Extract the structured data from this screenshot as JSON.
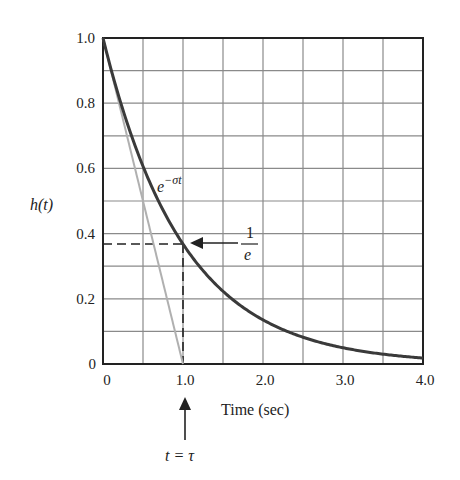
{
  "chart_data": {
    "type": "line",
    "title": "",
    "xlabel": "Time (sec)",
    "ylabel": "h(t)",
    "xlim": [
      0,
      4.0
    ],
    "ylim": [
      0,
      1.0
    ],
    "grid": true,
    "x_ticks": [
      "0",
      "1.0",
      "2.0",
      "3.0",
      "4.0"
    ],
    "y_ticks": [
      "0",
      "0.2",
      "0.4",
      "0.6",
      "0.8",
      "1.0"
    ],
    "x_grid_step": 0.5,
    "y_grid_step": 0.1,
    "series": [
      {
        "name": "e^{-σt}",
        "description": "Exponential decay with σ = 1",
        "x": [
          0,
          0.5,
          1.0,
          1.5,
          2.0,
          2.5,
          3.0,
          3.5,
          4.0
        ],
        "values": [
          1.0,
          0.607,
          0.368,
          0.223,
          0.135,
          0.082,
          0.05,
          0.03,
          0.018
        ],
        "color": "#3a3a3a"
      },
      {
        "name": "initial slope tangent",
        "x": [
          0,
          1.0
        ],
        "values": [
          1.0,
          0
        ],
        "color": "#b0b0b0"
      }
    ],
    "annotations": [
      {
        "text": "e^{−σt}",
        "x": 0.65,
        "y": 0.56
      },
      {
        "text": "1/e",
        "x": 1.4,
        "y": 0.368,
        "arrow_to": [
          1.0,
          0.368
        ]
      },
      {
        "text": "t = τ",
        "x": 1.0,
        "y": -0.25,
        "arrow_to": [
          1.0,
          -0.05
        ]
      },
      {
        "dashed_lines": [
          {
            "from": [
              0,
              0.368
            ],
            "to": [
              1.0,
              0.368
            ]
          },
          {
            "from": [
              1.0,
              0.368
            ],
            "to": [
              1.0,
              0
            ]
          }
        ]
      }
    ]
  },
  "labels": {
    "ylabel": "h(t)",
    "xlabel": "Time (sec)",
    "curve_label_base": "e",
    "curve_label_exp": "−σt",
    "one_over_e_num": "1",
    "one_over_e_den": "e",
    "tau_label": "t = τ"
  },
  "ticks": {
    "x": [
      "0",
      "1.0",
      "2.0",
      "3.0",
      "4.0"
    ],
    "y": [
      "0",
      "0.2",
      "0.4",
      "0.6",
      "0.8",
      "1.0"
    ]
  },
  "colors": {
    "curve": "#3a3a3a",
    "tangent": "#b0b0b0",
    "grid": "#8a8a8a",
    "axis": "#222222"
  }
}
